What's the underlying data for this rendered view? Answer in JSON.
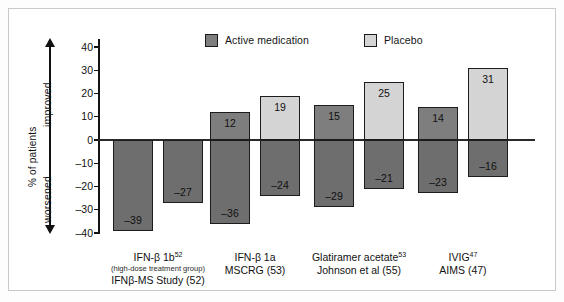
{
  "legend": {
    "active": {
      "label": "Active medication",
      "color": "#7e7e7e",
      "swatch": "legend-swatch-active"
    },
    "placebo": {
      "label": "Placebo",
      "color": "#d4d4d4",
      "swatch": "legend-swatch-placebo"
    }
  },
  "axis": {
    "ylabel": "% of patients",
    "improved_label": "improved",
    "worsened_label": "worsened",
    "ticks": [
      "40",
      "30",
      "20",
      "10",
      "0",
      "–10",
      "–20",
      "–30",
      "–40"
    ]
  },
  "chart_data": {
    "type": "bar",
    "title": "",
    "xlabel": "",
    "ylabel": "% of patients",
    "ylim": [
      -40,
      40
    ],
    "yticks": [
      40,
      30,
      20,
      10,
      0,
      -10,
      -20,
      -30,
      -40
    ],
    "grid": false,
    "legend_position": "top-right",
    "annotations": [
      "improved",
      "worsened"
    ],
    "categories": [
      "IFN-β 1b52 (high-dose treatment group) IFNβ-MS Study (52)",
      "IFN-β 1a MSCRG (53)",
      "Glatiramer acetate53 Johnson et al (55)",
      "IVIG47 AIMS (47)"
    ],
    "series": [
      {
        "name": "Active medication improved",
        "values": [
          0,
          12,
          15,
          14
        ]
      },
      {
        "name": "Active medication worsened",
        "values": [
          -39,
          -36,
          -29,
          -23
        ]
      },
      {
        "name": "Placebo improved",
        "values": [
          0,
          19,
          25,
          31
        ]
      },
      {
        "name": "Placebo worsened",
        "values": [
          -27,
          -24,
          -21,
          -16
        ]
      }
    ],
    "groups": [
      {
        "label_line1": "IFN-β 1b",
        "label_sup": "52",
        "label_line2": "(high-dose treatment group)",
        "label_line3": "IFNβ-MS Study (52)",
        "bars": [
          {
            "arm": "Active medication",
            "improved": null,
            "worsened": -39,
            "improved_text": "",
            "worsened_text": "–39"
          },
          {
            "arm": "Placebo",
            "improved": null,
            "worsened": -27,
            "improved_text": "",
            "worsened_text": "–27"
          }
        ]
      },
      {
        "label_line1": "IFN-β 1a",
        "label_sup": "",
        "label_line2": "",
        "label_line3": "MSCRG (53)",
        "bars": [
          {
            "arm": "Active medication",
            "improved": 12,
            "worsened": -36,
            "improved_text": "12",
            "worsened_text": "–36"
          },
          {
            "arm": "Placebo",
            "improved": 19,
            "worsened": -24,
            "improved_text": "19",
            "worsened_text": "–24"
          }
        ]
      },
      {
        "label_line1": "Glatiramer acetate",
        "label_sup": "53",
        "label_line2": "",
        "label_line3": "Johnson et al (55)",
        "bars": [
          {
            "arm": "Active medication",
            "improved": 15,
            "worsened": -29,
            "improved_text": "15",
            "worsened_text": "–29"
          },
          {
            "arm": "Placebo",
            "improved": 25,
            "worsened": -21,
            "improved_text": "25",
            "worsened_text": "–21"
          }
        ]
      },
      {
        "label_line1": "IVIG",
        "label_sup": "47",
        "label_line2": "",
        "label_line3": "AIMS (47)",
        "bars": [
          {
            "arm": "Active medication",
            "improved": 14,
            "worsened": -23,
            "improved_text": "14",
            "worsened_text": "–23"
          },
          {
            "arm": "Placebo",
            "improved": 31,
            "worsened": -16,
            "improved_text": "31",
            "worsened_text": "–16"
          }
        ]
      }
    ]
  },
  "colors": {
    "active": "#7e7e7e",
    "placebo": "#d4d4d4",
    "worsened_active": "#6e6e6e",
    "worsened_placebo": "#6e6e6e",
    "outline": "#1c1c1c",
    "frame": "#c9c9c9"
  }
}
